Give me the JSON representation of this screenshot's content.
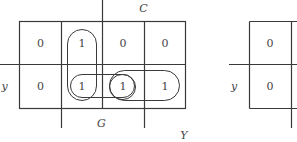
{
  "diagram": {
    "type": "karnaugh-map",
    "map_main": {
      "rows": [
        {
          "label": "",
          "cells": [
            "0",
            "1",
            "0",
            "0"
          ]
        },
        {
          "label": "y",
          "cells": [
            "0",
            "1",
            "1",
            "1"
          ]
        }
      ],
      "labels": {
        "top": "C",
        "bottom_left": "G",
        "bottom_right": "Y",
        "left_row2": "y"
      },
      "groupings": [
        {
          "name": "vertical-pair-col2",
          "covers": [
            "r1c2",
            "r2c2"
          ]
        },
        {
          "name": "horizontal-pair-col2-col3",
          "covers": [
            "r2c2",
            "r2c3"
          ]
        },
        {
          "name": "single-col3",
          "covers": [
            "r2c3"
          ]
        },
        {
          "name": "horizontal-pair-col3-col4",
          "covers": [
            "r2c3",
            "r2c4"
          ]
        }
      ]
    },
    "map_partial": {
      "rows": [
        {
          "label": "",
          "cells": [
            "0"
          ]
        },
        {
          "label": "y",
          "cells": [
            "0"
          ]
        }
      ],
      "labels": {
        "left_row2": "y"
      }
    }
  }
}
